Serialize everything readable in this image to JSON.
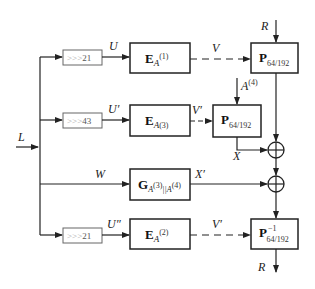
{
  "diagram": {
    "input": {
      "label": "L"
    },
    "rows": [
      {
        "shift": {
          "prefix": ">>>",
          "amount": "21"
        },
        "signal": "U",
        "block": {
          "name": "E",
          "sub": "A",
          "sup": "(1)"
        },
        "output": "V",
        "output_dashed": true
      },
      {
        "shift": {
          "prefix": ">>>",
          "amount": "43"
        },
        "signal": "U′",
        "block": {
          "name": "E",
          "sub": "A",
          "sup": "(3)"
        },
        "output": "V′",
        "output_dashed": true
      },
      {
        "signal": "W",
        "block": {
          "name": "G",
          "sub": "A",
          "sup": "(3)",
          "sub2": "||A",
          "sup2": "(4)"
        },
        "output": "X′",
        "output_dashed": false
      },
      {
        "shift": {
          "prefix": ">>>",
          "amount": "21"
        },
        "signal": "U″",
        "block": {
          "name": "E",
          "sub": "A",
          "sup": "(2)"
        },
        "output": "V′",
        "output_dashed": true
      }
    ],
    "permutations": [
      {
        "name": "P",
        "sub": "64/192",
        "sup": ""
      },
      {
        "name": "P",
        "sub": "64/192",
        "sup": ""
      },
      {
        "name": "P",
        "sub": "64/192",
        "sup": "−1"
      }
    ],
    "side_inputs": {
      "top_R": "R",
      "A4_label": "A",
      "A4_sup": "(4)",
      "X_label": "X"
    },
    "output": {
      "label": "R"
    },
    "xor_symbol": "⊕"
  }
}
